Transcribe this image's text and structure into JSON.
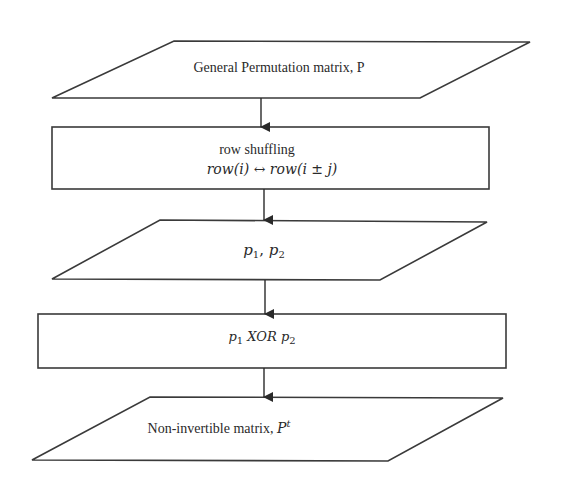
{
  "diagram": {
    "type": "flowchart",
    "direction": "top-to-bottom",
    "colors": {
      "stroke": "#3a3a3a",
      "fill": "#ffffff",
      "text": "#2a2a2a"
    },
    "nodes": [
      {
        "id": "n1",
        "shape": "parallelogram",
        "label": "General Permutation matrix, P"
      },
      {
        "id": "n2",
        "shape": "rectangle",
        "label": "row shuffling",
        "sublabel": {
          "lhs": "row(i)",
          "arrow": "↔",
          "rhs": "row(i ± j)"
        }
      },
      {
        "id": "n3",
        "shape": "parallelogram",
        "label": {
          "a": "p",
          "a_sub": "1",
          "sep": ", ",
          "b": "p",
          "b_sub": "2"
        }
      },
      {
        "id": "n4",
        "shape": "rectangle",
        "label": {
          "a": "p",
          "a_sub": "1",
          "op": " XOR ",
          "b": "p",
          "b_sub": "2"
        }
      },
      {
        "id": "n5",
        "shape": "parallelogram",
        "label": {
          "text": "Non-invertible matrix, ",
          "sym": "P",
          "sym_sup": "t"
        }
      }
    ],
    "edges": [
      {
        "from": "n1",
        "to": "n2"
      },
      {
        "from": "n2",
        "to": "n3"
      },
      {
        "from": "n3",
        "to": "n4"
      },
      {
        "from": "n4",
        "to": "n5"
      }
    ]
  }
}
